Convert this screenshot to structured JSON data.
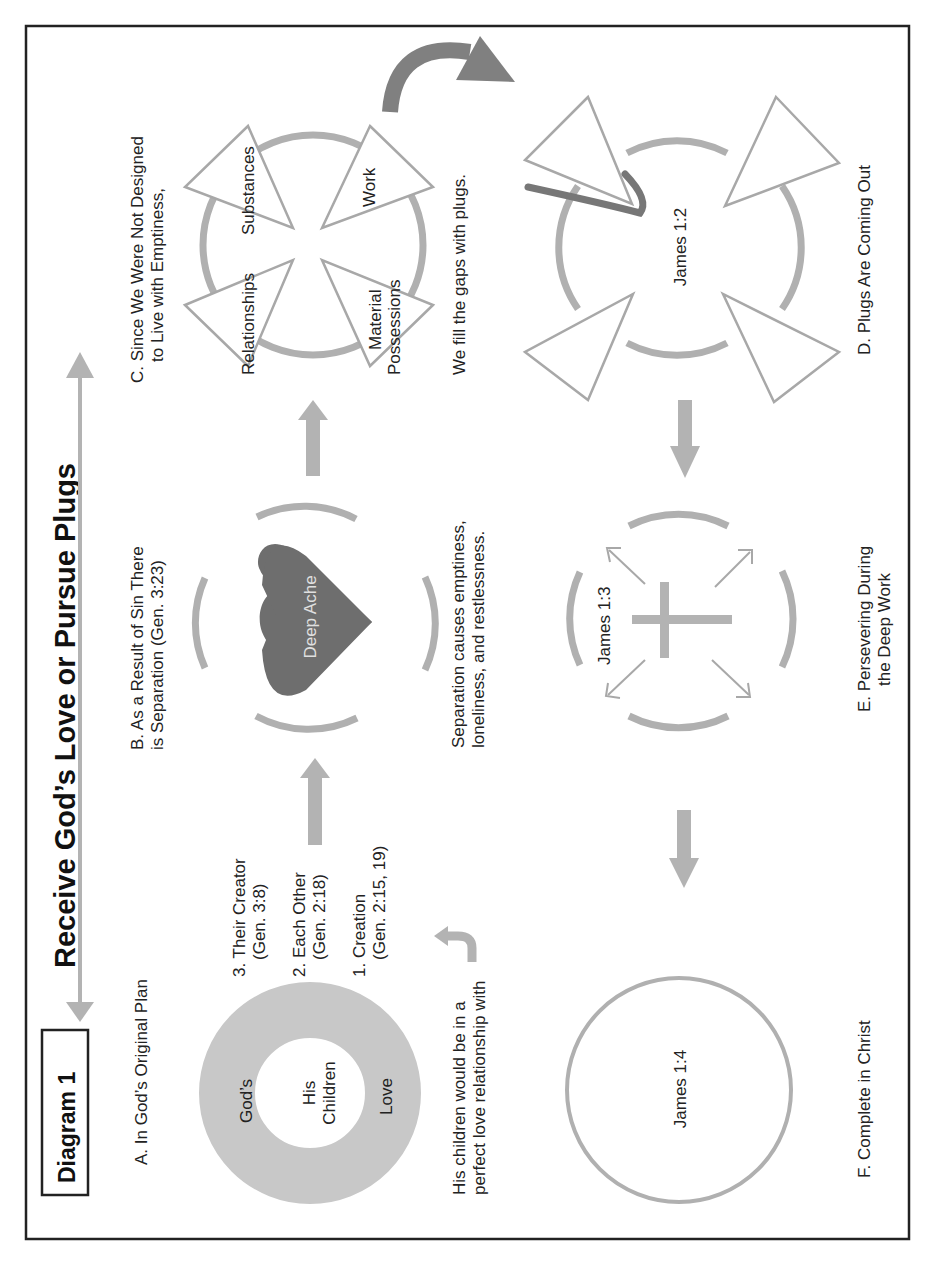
{
  "header": {
    "diagram_label": "Diagram 1",
    "title": "Receive God’s Love or Pursue Plugs"
  },
  "section_a": {
    "label": "A. In God’s Original Plan",
    "ring_outer": "God’s",
    "ring_bottom": "Love",
    "center_line1": "His",
    "center_line2": "Children",
    "list": [
      {
        "line1": "3. Their Creator",
        "line2": "(Gen.  3:8)"
      },
      {
        "line1": "2. Each Other",
        "line2": "(Gen. 2:18)"
      },
      {
        "line1": "1. Creation",
        "line2": "(Gen. 2:15, 19)"
      }
    ],
    "caption_line1": "His children would be in a",
    "caption_line2": "perfect love relationship with"
  },
  "section_b": {
    "label_line1": "B. As a Result of Sin There",
    "label_line2": "is Separation (Gen. 3:23)",
    "heart_text": "Deep Ache",
    "caption_line1": "Separation causes emptiness,",
    "caption_line2": "loneliness,  and restlessness."
  },
  "section_c": {
    "label_line1": "C. Since We Were Not Designed",
    "label_line2": "to Live with Emptiness,",
    "plugs": [
      "Relationships",
      "Substances",
      "Work",
      "Material",
      "Possessions"
    ],
    "caption": "We fill the gaps with plugs."
  },
  "section_d": {
    "label": "D. Plugs Are Coming Out",
    "center_text": "James 1:2"
  },
  "section_e": {
    "label_line1": "E. Persevering During",
    "label_line2": "the Deep Work",
    "center_text": "James 1:3"
  },
  "section_f": {
    "label": "F. Complete in Christ",
    "center_text": "James 1:4"
  },
  "colors": {
    "arrow_gray": "#b3b3b3",
    "dark_gray": "#777777",
    "heart": "#6e6e6e",
    "border": "#222222"
  }
}
